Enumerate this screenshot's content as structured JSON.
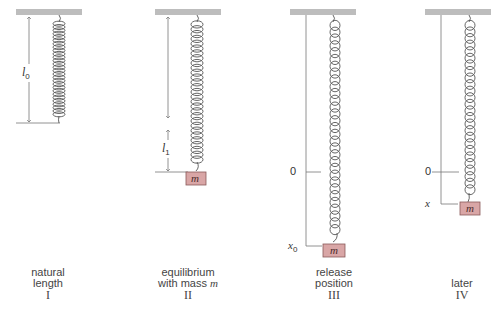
{
  "figure": {
    "panels": [
      {
        "id": "I",
        "caption_lines": [
          "natural",
          "length"
        ],
        "numeral": "I",
        "dimension_label": "l",
        "dimension_sub": "0"
      },
      {
        "id": "II",
        "caption_lines": [
          "equilibrium",
          "with mass "
        ],
        "caption_italic": "m",
        "numeral": "II",
        "dimension_label": "l",
        "dimension_sub": "1",
        "mass_label": "m"
      },
      {
        "id": "III",
        "caption_lines": [
          "release",
          "position"
        ],
        "numeral": "III",
        "zero_label": "0",
        "pos_label": "x",
        "pos_sub": "0",
        "mass_label": "m"
      },
      {
        "id": "IV",
        "caption_lines": [
          "later"
        ],
        "numeral": "IV",
        "zero_label": "0",
        "pos_label": "x",
        "mass_label": "m"
      }
    ],
    "colors": {
      "ceiling": "#bdbdbd",
      "spring": "#555555",
      "mass_fill": "#d9a6a6",
      "mass_stroke": "#8a5a5a",
      "line": "#777777"
    }
  }
}
